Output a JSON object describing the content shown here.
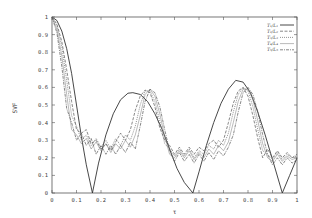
{
  "chart_data": {
    "type": "line",
    "title": "",
    "xlabel": "τ",
    "ylabel": "SVF",
    "xlim": [
      0,
      1
    ],
    "ylim": [
      0,
      1
    ],
    "xticks": [
      "0",
      "0.1",
      "0.2",
      "0.3",
      "0.4",
      "0.5",
      "0.6",
      "0.7",
      "0.8",
      "0.9",
      "1"
    ],
    "yticks": [
      "0",
      "0.1",
      "0.2",
      "0.3",
      "0.4",
      "0.5",
      "0.6",
      "0.7",
      "0.8",
      "0.9",
      "1"
    ],
    "grid": false,
    "legend_position": "upper right (inside)",
    "series": [
      {
        "name": "T₁/L₁",
        "style": "solid",
        "x": [
          0,
          0.02,
          0.04,
          0.06,
          0.08,
          0.1,
          0.12,
          0.14,
          0.165,
          0.19,
          0.22,
          0.25,
          0.28,
          0.31,
          0.33,
          0.36,
          0.39,
          0.42,
          0.45,
          0.48,
          0.51,
          0.54,
          0.575,
          0.6,
          0.63,
          0.66,
          0.69,
          0.72,
          0.75,
          0.78,
          0.81,
          0.84,
          0.87,
          0.9,
          0.94,
          0.97,
          1.0
        ],
        "values": [
          1.0,
          0.98,
          0.92,
          0.82,
          0.68,
          0.5,
          0.32,
          0.16,
          0.0,
          0.17,
          0.33,
          0.45,
          0.53,
          0.567,
          0.57,
          0.56,
          0.52,
          0.45,
          0.36,
          0.25,
          0.14,
          0.06,
          0.0,
          0.12,
          0.27,
          0.4,
          0.51,
          0.59,
          0.64,
          0.63,
          0.57,
          0.46,
          0.33,
          0.19,
          0.0,
          0.1,
          0.2
        ]
      },
      {
        "name": "T₂/L₂",
        "style": "dashed",
        "x": [
          0,
          0.02,
          0.04,
          0.06,
          0.08,
          0.1,
          0.12,
          0.14,
          0.16,
          0.18,
          0.2,
          0.22,
          0.24,
          0.26,
          0.28,
          0.3,
          0.32,
          0.34,
          0.36,
          0.38,
          0.4,
          0.42,
          0.44,
          0.46,
          0.48,
          0.5,
          0.52,
          0.54,
          0.56,
          0.58,
          0.6,
          0.62,
          0.64,
          0.66,
          0.68,
          0.7,
          0.72,
          0.74,
          0.76,
          0.78,
          0.8,
          0.82,
          0.84,
          0.86,
          0.88,
          0.9,
          0.92,
          0.94,
          0.96,
          0.98,
          1.0
        ],
        "values": [
          1.0,
          0.96,
          0.86,
          0.7,
          0.52,
          0.36,
          0.34,
          0.36,
          0.28,
          0.3,
          0.25,
          0.28,
          0.24,
          0.29,
          0.34,
          0.3,
          0.36,
          0.47,
          0.55,
          0.585,
          0.57,
          0.49,
          0.37,
          0.3,
          0.27,
          0.22,
          0.26,
          0.22,
          0.26,
          0.22,
          0.26,
          0.24,
          0.28,
          0.3,
          0.26,
          0.3,
          0.4,
          0.51,
          0.58,
          0.6,
          0.55,
          0.44,
          0.31,
          0.2,
          0.25,
          0.2,
          0.24,
          0.2,
          0.23,
          0.2,
          0.22
        ]
      },
      {
        "name": "T₃/L₃",
        "style": "dotted",
        "x": [
          0,
          0.02,
          0.04,
          0.06,
          0.08,
          0.1,
          0.12,
          0.14,
          0.16,
          0.18,
          0.2,
          0.22,
          0.24,
          0.26,
          0.28,
          0.3,
          0.32,
          0.34,
          0.36,
          0.38,
          0.4,
          0.42,
          0.44,
          0.46,
          0.48,
          0.5,
          0.52,
          0.54,
          0.56,
          0.58,
          0.6,
          0.62,
          0.64,
          0.66,
          0.68,
          0.7,
          0.72,
          0.74,
          0.76,
          0.78,
          0.8,
          0.82,
          0.84,
          0.86,
          0.88,
          0.9,
          0.92,
          0.94,
          0.96,
          0.98,
          1.0
        ],
        "values": [
          1.0,
          0.95,
          0.83,
          0.64,
          0.44,
          0.38,
          0.3,
          0.33,
          0.27,
          0.31,
          0.26,
          0.3,
          0.25,
          0.31,
          0.27,
          0.33,
          0.3,
          0.38,
          0.5,
          0.58,
          0.58,
          0.52,
          0.41,
          0.28,
          0.25,
          0.21,
          0.25,
          0.21,
          0.25,
          0.2,
          0.24,
          0.22,
          0.27,
          0.25,
          0.3,
          0.27,
          0.34,
          0.46,
          0.56,
          0.6,
          0.58,
          0.49,
          0.36,
          0.24,
          0.22,
          0.19,
          0.23,
          0.19,
          0.22,
          0.2,
          0.21
        ]
      },
      {
        "name": "T₄/L₄",
        "style": "solid-thin",
        "x": [
          0,
          0.02,
          0.04,
          0.06,
          0.08,
          0.1,
          0.12,
          0.14,
          0.16,
          0.18,
          0.2,
          0.22,
          0.24,
          0.26,
          0.28,
          0.3,
          0.32,
          0.34,
          0.36,
          0.38,
          0.4,
          0.42,
          0.44,
          0.46,
          0.48,
          0.5,
          0.52,
          0.54,
          0.56,
          0.58,
          0.6,
          0.62,
          0.64,
          0.66,
          0.68,
          0.7,
          0.72,
          0.74,
          0.76,
          0.78,
          0.8,
          0.82,
          0.84,
          0.86,
          0.88,
          0.9,
          0.92,
          0.94,
          0.96,
          0.98,
          1.0
        ],
        "values": [
          1.0,
          0.93,
          0.78,
          0.56,
          0.36,
          0.33,
          0.28,
          0.31,
          0.25,
          0.29,
          0.24,
          0.28,
          0.23,
          0.28,
          0.25,
          0.3,
          0.26,
          0.33,
          0.44,
          0.56,
          0.59,
          0.55,
          0.45,
          0.32,
          0.22,
          0.2,
          0.24,
          0.2,
          0.24,
          0.19,
          0.23,
          0.2,
          0.25,
          0.22,
          0.27,
          0.24,
          0.29,
          0.4,
          0.52,
          0.59,
          0.59,
          0.53,
          0.41,
          0.28,
          0.2,
          0.18,
          0.22,
          0.18,
          0.21,
          0.19,
          0.2
        ]
      },
      {
        "name": "T₅/L₅",
        "style": "dash-dot",
        "x": [
          0,
          0.02,
          0.04,
          0.06,
          0.08,
          0.1,
          0.12,
          0.14,
          0.16,
          0.18,
          0.2,
          0.22,
          0.24,
          0.26,
          0.28,
          0.3,
          0.32,
          0.34,
          0.36,
          0.38,
          0.4,
          0.42,
          0.44,
          0.46,
          0.48,
          0.5,
          0.52,
          0.54,
          0.56,
          0.58,
          0.6,
          0.62,
          0.64,
          0.66,
          0.68,
          0.7,
          0.72,
          0.74,
          0.76,
          0.78,
          0.8,
          0.82,
          0.84,
          0.86,
          0.88,
          0.9,
          0.92,
          0.94,
          0.96,
          0.98,
          1.0
        ],
        "values": [
          1.0,
          0.91,
          0.72,
          0.48,
          0.4,
          0.3,
          0.34,
          0.27,
          0.31,
          0.22,
          0.27,
          0.22,
          0.27,
          0.22,
          0.27,
          0.23,
          0.29,
          0.25,
          0.38,
          0.52,
          0.59,
          0.57,
          0.49,
          0.36,
          0.24,
          0.18,
          0.23,
          0.18,
          0.22,
          0.17,
          0.22,
          0.18,
          0.23,
          0.19,
          0.24,
          0.21,
          0.26,
          0.33,
          0.46,
          0.57,
          0.6,
          0.56,
          0.46,
          0.33,
          0.22,
          0.16,
          0.2,
          0.16,
          0.2,
          0.17,
          0.19
        ]
      }
    ]
  },
  "axes": {
    "xlabel": "τ",
    "ylabel": "SVF"
  }
}
